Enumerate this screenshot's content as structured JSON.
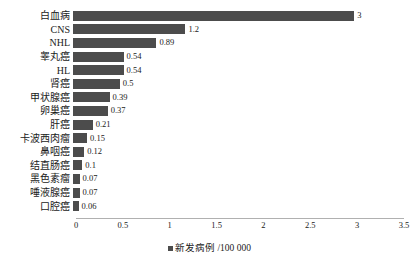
{
  "chart_data": {
    "type": "bar",
    "orientation": "horizontal",
    "title": "",
    "subtitle": "",
    "xlabel": "",
    "ylabel": "",
    "xlim": [
      0,
      3.5
    ],
    "xticks": [
      "0",
      "0.5",
      "1",
      "1.5",
      "2",
      "2.5",
      "3",
      "3.5"
    ],
    "xtick_values": [
      0,
      0.5,
      1,
      1.5,
      2,
      2.5,
      3,
      3.5
    ],
    "grid": false,
    "legend_position": "bottom-center",
    "legend": [
      "新发病例 /100 000"
    ],
    "series_color": "#4c4c4c",
    "categories": [
      "白血病",
      "CNS",
      "NHL",
      "睾丸癌",
      "HL",
      "肾癌",
      "甲状腺癌",
      "卵巢癌",
      "肝癌",
      "卡波西肉瘤",
      "鼻咽癌",
      "结直肠癌",
      "黑色素瘤",
      "唾液腺癌",
      "口腔癌"
    ],
    "values": [
      3,
      1.2,
      0.89,
      0.54,
      0.54,
      0.5,
      0.39,
      0.37,
      0.21,
      0.15,
      0.12,
      0.1,
      0.07,
      0.07,
      0.06
    ],
    "value_labels": [
      "3",
      "1.2",
      "0.89",
      "0.54",
      "0.54",
      "0.5",
      "0.39",
      "0.37",
      "0.21",
      "0.15",
      "0.12",
      "0.1",
      "0.07",
      "0.07",
      "0.06"
    ],
    "series": [
      {
        "name": "新发病例 /100 000",
        "values": [
          3,
          1.2,
          0.89,
          0.54,
          0.54,
          0.5,
          0.39,
          0.37,
          0.21,
          0.15,
          0.12,
          0.1,
          0.07,
          0.07,
          0.06
        ]
      }
    ]
  },
  "legend": {
    "label": "新发病例 /100 000"
  },
  "colors": {
    "bar": "#4c4c4c",
    "axis": "#b0b0b0",
    "text": "#1a1a1a",
    "background": "#ffffff"
  }
}
